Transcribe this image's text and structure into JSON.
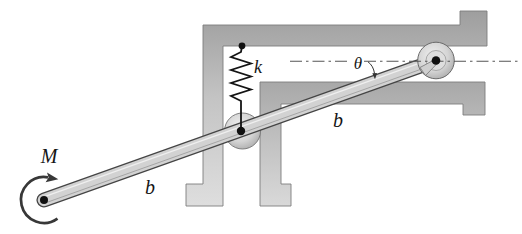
{
  "figure": {
    "type": "mechanics-statics-diagram",
    "labels": {
      "moment": "M",
      "length_lower": "b",
      "length_upper": "b",
      "spring_constant": "k",
      "angle": "θ"
    },
    "colors": {
      "background": "#ffffff",
      "structure_gray_dark": "#a2a2a2",
      "structure_gray_light": "#dcdcdc",
      "bar_fill": "#d2d2d2",
      "outline": "#454545",
      "ink": "#161616"
    }
  }
}
